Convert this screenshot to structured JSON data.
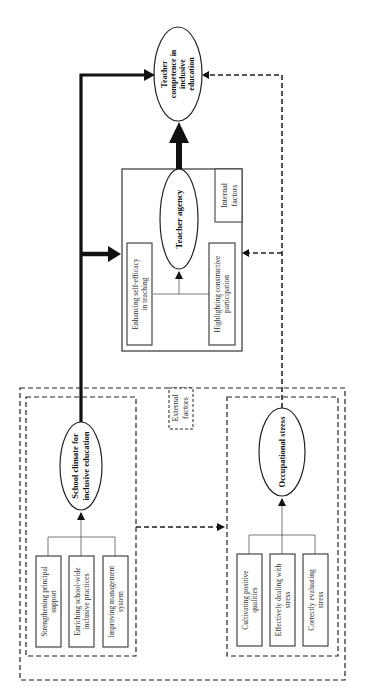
{
  "diagram": {
    "orientation": "rotated-90-ccw",
    "nodes": {
      "outcome": {
        "lines": [
          "Teacher",
          "competence in",
          "inclusive",
          "education"
        ]
      },
      "teacher_agency": {
        "label": "Teacher agency",
        "group_label_lines": [
          "Internal",
          "factors"
        ],
        "sub_items": [
          {
            "lines": [
              "Enhancing self-efficacy",
              "in teaching"
            ]
          },
          {
            "lines": [
              "Highlighting constructive",
              "participation"
            ]
          }
        ]
      },
      "school_climate": {
        "lines": [
          "School climate for",
          "inclusive education"
        ],
        "sub_items": [
          {
            "lines": [
              "Strengthening principal",
              "support"
            ]
          },
          {
            "lines": [
              "Enriching school-wide",
              "inclusive practices"
            ]
          },
          {
            "lines": [
              "Improving management",
              "system"
            ]
          }
        ]
      },
      "occupational_stress": {
        "label": "Occupational stress",
        "sub_items": [
          {
            "lines": [
              "Cultivating positive",
              "qualities"
            ]
          },
          {
            "lines": [
              "Effectively dealing with",
              "stress"
            ]
          },
          {
            "lines": [
              "Correctly evaluating",
              "stress"
            ]
          }
        ]
      },
      "external_factors": {
        "lines": [
          "External",
          "factors"
        ]
      }
    },
    "edges": [
      {
        "from": "school_climate",
        "to": "outcome",
        "style": "solid-thick"
      },
      {
        "from": "school_climate",
        "to": "teacher_agency",
        "style": "solid-thick"
      },
      {
        "from": "teacher_agency",
        "to": "outcome",
        "style": "solid-extra-thick"
      },
      {
        "from": "occupational_stress",
        "to": "outcome",
        "style": "dashed"
      },
      {
        "from": "occupational_stress",
        "to": "teacher_agency",
        "style": "dashed"
      },
      {
        "from": "school_climate",
        "to": "occupational_stress",
        "style": "dashed"
      }
    ],
    "colors": {
      "line": "#111111",
      "text": "#333333",
      "background": "#ffffff"
    }
  }
}
